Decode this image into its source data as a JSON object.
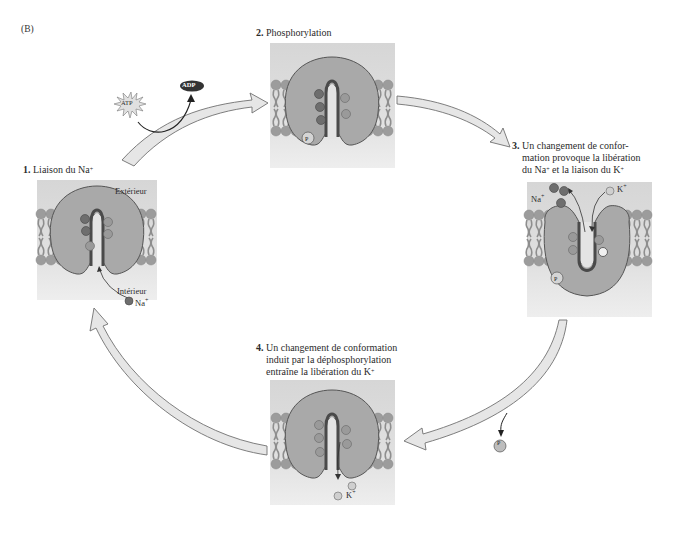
{
  "figure": {
    "panel_label": "(B)",
    "steps": [
      {
        "number": "1.",
        "title": "Liaison du Na",
        "superscript": "+"
      },
      {
        "number": "2.",
        "title": "Phosphorylation"
      },
      {
        "number": "3.",
        "title_lines": [
          "Un changement de confor-",
          "mation provoque la libération",
          "du Na",
          "+",
          " et la liaison du K",
          "+"
        ]
      },
      {
        "number": "4.",
        "title_lines": [
          "Un changement de conformation",
          "induit par la déphosphorylation",
          "entraîne la libération du K",
          "+"
        ]
      }
    ],
    "labels": {
      "exterior": "Extérieur",
      "interior": "Intérieur",
      "na": "Na",
      "k": "K",
      "plus": "+",
      "atp": "ATP",
      "adp": "ADP",
      "pi": "P",
      "pi_sub": "i"
    },
    "colors": {
      "panel_bg_top": "#d9d9d9",
      "panel_bg_bottom": "#ececec",
      "protein": "#a8a8a8",
      "protein_stroke": "#5a5a5a",
      "lipid_head": "#9a9a9a",
      "lipid_tail": "#8c8c8c",
      "na_ion": "#6e6e6e",
      "k_ion": "#cfcfcf",
      "arrow_fill": "#e6e6e6",
      "arrow_stroke": "#707070",
      "adp_fill": "#333333"
    }
  }
}
